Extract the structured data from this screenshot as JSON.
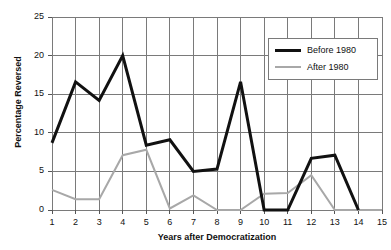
{
  "chart_data": {
    "type": "line",
    "title": "",
    "xlabel": "Years after Democratization",
    "ylabel": "Percentage Reversed",
    "x": [
      1,
      2,
      3,
      4,
      5,
      6,
      7,
      8,
      9,
      10,
      11,
      12,
      13,
      14,
      15
    ],
    "xlim": [
      1,
      15
    ],
    "ylim": [
      0,
      25
    ],
    "yticks": [
      0,
      5,
      10,
      15,
      20,
      25
    ],
    "xticks": [
      1,
      2,
      3,
      4,
      5,
      6,
      7,
      8,
      9,
      10,
      11,
      12,
      13,
      14,
      15
    ],
    "grid": true,
    "legend_position": "top-right",
    "series": [
      {
        "name": "Before 1980",
        "color": "#111111",
        "width": 3,
        "values": [
          8.7,
          16.6,
          14.2,
          20.0,
          8.4,
          9.1,
          5.0,
          5.3,
          16.6,
          0.0,
          0.0,
          6.7,
          7.1,
          0.0,
          null
        ]
      },
      {
        "name": "After 1980",
        "color": "#a8a8a8",
        "width": 2,
        "values": [
          2.6,
          1.4,
          1.4,
          7.1,
          7.8,
          0.2,
          1.9,
          0.0,
          0.0,
          2.1,
          2.2,
          4.5,
          0.0,
          0.0,
          0.0
        ]
      }
    ]
  },
  "axis": {
    "y_tick_labels": [
      "0",
      "5",
      "10",
      "15",
      "20",
      "25"
    ],
    "x_tick_labels": [
      "1",
      "2",
      "3",
      "4",
      "5",
      "6",
      "7",
      "8",
      "9",
      "10",
      "11",
      "12",
      "13",
      "14",
      "15"
    ],
    "y_title": "Percentage Reversed",
    "x_title": "Years after Democratization"
  },
  "legend": {
    "items": [
      {
        "label": "Before 1980",
        "swatch": "black-line-swatch"
      },
      {
        "label": "After 1980",
        "swatch": "gray-line-swatch"
      }
    ]
  },
  "colors": {
    "series_before": "#111111",
    "series_after": "#a8a8a8",
    "grid": "#7a7a7a",
    "axis": "#555555",
    "background": "#ffffff"
  }
}
